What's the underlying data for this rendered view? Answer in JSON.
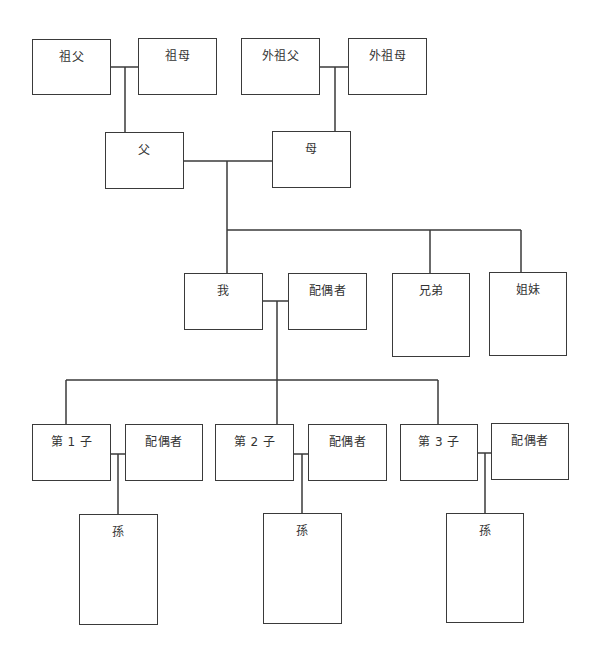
{
  "diagram": {
    "type": "family-tree",
    "line_color": "#3a3a3a",
    "nodes": {
      "paternal_grandfather": "祖父",
      "paternal_grandmother": "祖母",
      "maternal_grandfather": "外祖父",
      "maternal_grandmother": "外祖母",
      "father": "父",
      "mother": "母",
      "self": "我",
      "self_spouse": "配偶者",
      "brothers": "兄弟",
      "sisters": "姐妹",
      "children": [
        {
          "label": "第 1 子",
          "spouse": "配偶者",
          "grandchild": "孫"
        },
        {
          "label": "第 2 子",
          "spouse": "配偶者",
          "grandchild": "孫"
        },
        {
          "label": "第 3 子",
          "spouse": "配偶者",
          "grandchild": "孫"
        }
      ]
    }
  }
}
